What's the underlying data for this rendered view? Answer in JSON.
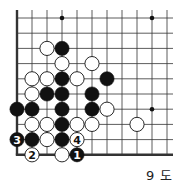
{
  "diagram": {
    "caption": "9 도",
    "grid": {
      "cols": 11,
      "rows": 10,
      "origin_x": 17,
      "origin_y": 18,
      "spacing_x": 15,
      "spacing_y": 15.2,
      "left_edge": true,
      "bottom_edge": true,
      "line_color": "#333333"
    },
    "star_points": [
      {
        "c": 3,
        "r": 0
      },
      {
        "c": 9,
        "r": 0
      },
      {
        "c": 9,
        "r": 6
      }
    ],
    "stones": [
      {
        "c": 2,
        "r": 2,
        "color": "white",
        "label": ""
      },
      {
        "c": 3,
        "r": 2,
        "color": "black",
        "label": ""
      },
      {
        "c": 3,
        "r": 3,
        "color": "white",
        "label": ""
      },
      {
        "c": 5,
        "r": 3,
        "color": "white",
        "label": ""
      },
      {
        "c": 1,
        "r": 4,
        "color": "white",
        "label": ""
      },
      {
        "c": 2,
        "r": 4,
        "color": "white",
        "label": ""
      },
      {
        "c": 3,
        "r": 4,
        "color": "black",
        "label": ""
      },
      {
        "c": 4,
        "r": 4,
        "color": "white",
        "label": ""
      },
      {
        "c": 6,
        "r": 4,
        "color": "black",
        "label": ""
      },
      {
        "c": 1,
        "r": 5,
        "color": "white",
        "label": ""
      },
      {
        "c": 2,
        "r": 5,
        "color": "black",
        "label": ""
      },
      {
        "c": 3,
        "r": 5,
        "color": "black",
        "label": ""
      },
      {
        "c": 5,
        "r": 5,
        "color": "black",
        "label": ""
      },
      {
        "c": 0,
        "r": 6,
        "color": "black",
        "label": ""
      },
      {
        "c": 1,
        "r": 6,
        "color": "black",
        "label": ""
      },
      {
        "c": 3,
        "r": 6,
        "color": "black",
        "label": ""
      },
      {
        "c": 5,
        "r": 6,
        "color": "black",
        "label": ""
      },
      {
        "c": 6,
        "r": 6,
        "color": "white",
        "label": ""
      },
      {
        "c": 1,
        "r": 7,
        "color": "white",
        "label": ""
      },
      {
        "c": 2,
        "r": 7,
        "color": "white",
        "label": ""
      },
      {
        "c": 3,
        "r": 7,
        "color": "black",
        "label": ""
      },
      {
        "c": 4,
        "r": 7,
        "color": "white",
        "label": ""
      },
      {
        "c": 5,
        "r": 7,
        "color": "white",
        "label": ""
      },
      {
        "c": 8,
        "r": 7,
        "color": "white",
        "label": ""
      },
      {
        "c": 0,
        "r": 8,
        "color": "black",
        "label": "3"
      },
      {
        "c": 1,
        "r": 8,
        "color": "black",
        "label": ""
      },
      {
        "c": 2,
        "r": 8,
        "color": "white",
        "label": ""
      },
      {
        "c": 3,
        "r": 8,
        "color": "black",
        "label": ""
      },
      {
        "c": 4,
        "r": 8,
        "color": "white",
        "label": "4"
      },
      {
        "c": 1,
        "r": 9,
        "color": "white",
        "label": "2"
      },
      {
        "c": 3,
        "r": 9,
        "color": "white",
        "label": ""
      },
      {
        "c": 4,
        "r": 9,
        "color": "black",
        "label": "1"
      }
    ]
  }
}
